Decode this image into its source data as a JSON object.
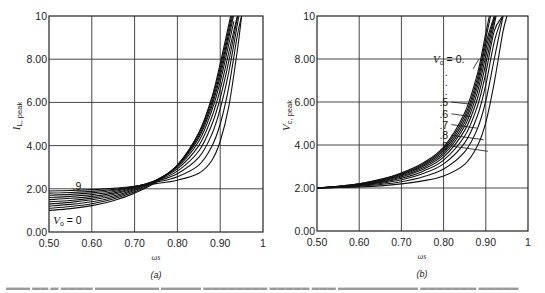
{
  "chart_data": [
    {
      "id": "a",
      "type": "line",
      "panel_label": "(a)",
      "title": "",
      "xlabel": "ωs",
      "ylabel": "I_L, peak",
      "ylabel_main": "I",
      "ylabel_sub": "L, peak",
      "xlim": [
        0.5,
        1.0
      ],
      "ylim": [
        0,
        10
      ],
      "grid": true,
      "x_ticks": [
        "0.50",
        "0.60",
        "0.70",
        "0.80",
        "0.90",
        "1"
      ],
      "y_ticks": [
        "0.00",
        "2.00",
        "4.00",
        "6.00",
        "8.00",
        "10"
      ],
      "annotations": [
        {
          "text": ".9",
          "x": 0.555,
          "y": 2.15
        },
        {
          "text": "Vo = 0",
          "x": 0.51,
          "y": 0.55
        }
      ],
      "x": [
        0.5,
        0.55,
        0.6,
        0.65,
        0.7,
        0.75,
        0.8,
        0.85,
        0.88,
        0.9,
        0.92,
        0.94,
        0.95
      ],
      "series": [
        {
          "name": "Vo = 0",
          "values": [
            1.0,
            1.08,
            1.22,
            1.45,
            1.8,
            2.3,
            3.1,
            4.6,
            6.2,
            7.8,
            9.6,
            null,
            null
          ]
        },
        {
          "name": "Vo = 0.1",
          "values": [
            1.1,
            1.18,
            1.31,
            1.53,
            1.86,
            2.34,
            3.1,
            4.55,
            6.1,
            7.6,
            9.4,
            null,
            null
          ]
        },
        {
          "name": "Vo = 0.2",
          "values": [
            1.2,
            1.28,
            1.4,
            1.6,
            1.92,
            2.37,
            3.08,
            4.45,
            5.95,
            7.4,
            9.2,
            null,
            null
          ]
        },
        {
          "name": "Vo = 0.3",
          "values": [
            1.3,
            1.37,
            1.49,
            1.67,
            1.97,
            2.39,
            3.05,
            4.35,
            5.8,
            7.2,
            9.0,
            null,
            null
          ]
        },
        {
          "name": "Vo = 0.4",
          "values": [
            1.4,
            1.46,
            1.57,
            1.74,
            2.01,
            2.4,
            3.0,
            4.2,
            5.6,
            6.95,
            8.7,
            null,
            null
          ]
        },
        {
          "name": "Vo = 0.5",
          "values": [
            1.5,
            1.56,
            1.65,
            1.8,
            2.05,
            2.4,
            2.92,
            4.0,
            5.3,
            6.6,
            8.3,
            10.0,
            null
          ]
        },
        {
          "name": "Vo = 0.6",
          "values": [
            1.6,
            1.65,
            1.73,
            1.86,
            2.08,
            2.38,
            2.82,
            3.75,
            4.95,
            6.2,
            7.9,
            9.9,
            null
          ]
        },
        {
          "name": "Vo = 0.7",
          "values": [
            1.7,
            1.74,
            1.81,
            1.92,
            2.1,
            2.35,
            2.7,
            3.45,
            4.5,
            5.7,
            7.4,
            9.6,
            null
          ]
        },
        {
          "name": "Vo = 0.8",
          "values": [
            1.8,
            1.83,
            1.88,
            1.97,
            2.11,
            2.3,
            2.56,
            3.1,
            3.95,
            5.0,
            6.7,
            9.1,
            10.0
          ]
        },
        {
          "name": "Vo = 0.9",
          "values": [
            1.9,
            1.92,
            1.96,
            2.02,
            2.12,
            2.24,
            2.4,
            2.72,
            3.3,
            4.2,
            5.8,
            8.4,
            10.0
          ]
        }
      ]
    },
    {
      "id": "b",
      "type": "line",
      "panel_label": "(b)",
      "title": "",
      "xlabel": "ωs",
      "ylabel": "V_c, peak",
      "ylabel_main": "V",
      "ylabel_sub": "c, peak",
      "xlim": [
        0.5,
        1.0
      ],
      "ylim": [
        0,
        10
      ],
      "grid": true,
      "x_ticks": [
        "0.50",
        "0.60",
        "0.70",
        "0.80",
        "0.90",
        "1"
      ],
      "y_ticks": [
        "0.00",
        "2.00",
        "4.00",
        "6.00",
        "8.00",
        "10"
      ],
      "annotations": [
        {
          "text": "Vo = 0.",
          "x": 0.775,
          "y": 8.0
        },
        {
          "text": ".",
          "x": 0.803,
          "y": 7.4
        },
        {
          "text": ".",
          "x": 0.803,
          "y": 6.95
        },
        {
          "text": ".",
          "x": 0.803,
          "y": 6.5
        },
        {
          "text": ".5",
          "x": 0.79,
          "y": 6.0
        },
        {
          "text": ".6",
          "x": 0.79,
          "y": 5.45
        },
        {
          "text": ".7",
          "x": 0.79,
          "y": 4.95
        },
        {
          "text": ".8",
          "x": 0.79,
          "y": 4.45
        },
        {
          "text": ".9",
          "x": 0.79,
          "y": 3.95
        }
      ],
      "x": [
        0.5,
        0.55,
        0.6,
        0.65,
        0.7,
        0.75,
        0.8,
        0.85,
        0.88,
        0.9,
        0.92,
        0.94,
        0.95
      ],
      "series": [
        {
          "name": "Vo = 0",
          "values": [
            2.0,
            2.08,
            2.2,
            2.4,
            2.7,
            3.15,
            3.9,
            5.5,
            7.3,
            9.2,
            null,
            null,
            null
          ]
        },
        {
          "name": "Vo = 0.1",
          "values": [
            2.0,
            2.08,
            2.19,
            2.38,
            2.67,
            3.1,
            3.82,
            5.35,
            7.1,
            8.95,
            null,
            null,
            null
          ]
        },
        {
          "name": "Vo = 0.2",
          "values": [
            2.0,
            2.07,
            2.18,
            2.36,
            2.64,
            3.05,
            3.74,
            5.2,
            6.9,
            8.7,
            10.0,
            null,
            null
          ]
        },
        {
          "name": "Vo = 0.3",
          "values": [
            2.0,
            2.07,
            2.17,
            2.34,
            2.6,
            3.0,
            3.65,
            5.05,
            6.7,
            8.45,
            9.9,
            null,
            null
          ]
        },
        {
          "name": "Vo = 0.4",
          "values": [
            2.0,
            2.06,
            2.16,
            2.31,
            2.56,
            2.93,
            3.55,
            4.88,
            6.45,
            8.15,
            9.8,
            null,
            null
          ]
        },
        {
          "name": "Vo = 0.5",
          "values": [
            2.0,
            2.06,
            2.15,
            2.28,
            2.51,
            2.86,
            3.44,
            4.68,
            6.15,
            7.8,
            9.6,
            null,
            null
          ]
        },
        {
          "name": "Vo = 0.6",
          "values": [
            2.0,
            2.05,
            2.13,
            2.25,
            2.45,
            2.77,
            3.3,
            4.42,
            5.8,
            7.35,
            9.3,
            10.0,
            null
          ]
        },
        {
          "name": "Vo = 0.7",
          "values": [
            2.0,
            2.04,
            2.11,
            2.21,
            2.38,
            2.66,
            3.12,
            4.1,
            5.35,
            6.8,
            8.8,
            10.0,
            null
          ]
        },
        {
          "name": "Vo = 0.8",
          "values": [
            2.0,
            2.03,
            2.08,
            2.16,
            2.29,
            2.51,
            2.88,
            3.68,
            4.75,
            6.05,
            8.0,
            9.9,
            null
          ]
        },
        {
          "name": "Vo = 0.9",
          "values": [
            2.0,
            2.02,
            2.05,
            2.1,
            2.19,
            2.33,
            2.56,
            3.1,
            3.95,
            5.05,
            6.9,
            9.2,
            10.0
          ]
        }
      ]
    }
  ],
  "figure": {
    "caption_visible": "(partially cut off, illegible)"
  }
}
